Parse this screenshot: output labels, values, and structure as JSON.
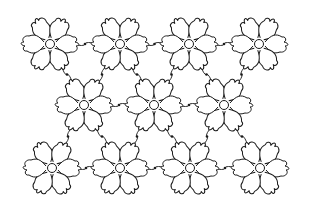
{
  "image": {
    "description": "Black line-art quilting pattern of six-petal flowers connected by wavy stems",
    "background": "#ffffff",
    "stroke": "#1a1a1a",
    "petal_count": 6,
    "rows": [
      {
        "name": "top",
        "y": 44,
        "centers_x": [
          50,
          120,
          189,
          259
        ]
      },
      {
        "name": "middle",
        "y": 105,
        "centers_x": [
          84,
          154,
          224
        ]
      },
      {
        "name": "bottom",
        "y": 168,
        "centers_x": [
          52,
          120,
          190,
          260
        ]
      }
    ]
  }
}
